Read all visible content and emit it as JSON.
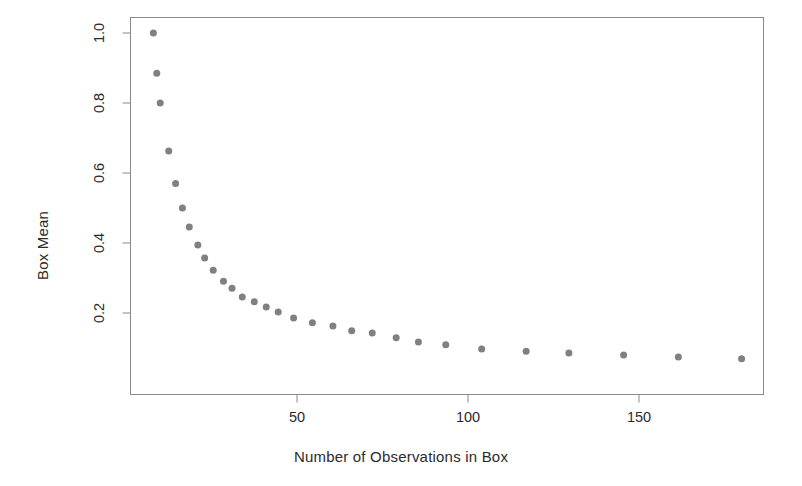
{
  "chart_data": {
    "type": "scatter",
    "title": "",
    "xlabel": "Number of Observations in Box",
    "ylabel": "Box Mean",
    "xlim": [
      4,
      186
    ],
    "ylim": [
      0.03,
      1.04
    ],
    "grid": false,
    "legend": null,
    "point_color": "#808080",
    "point_size": 7,
    "xticks": [
      50,
      100,
      150
    ],
    "xtick_labels": [
      "50",
      "100",
      "150"
    ],
    "yticks": [
      0.2,
      0.4,
      0.6,
      0.8,
      1.0
    ],
    "ytick_labels": [
      "0.2",
      "0.4",
      "0.6",
      "0.8",
      "1.0"
    ],
    "series": [
      {
        "name": "Box Mean",
        "x": [
          8,
          9,
          10,
          12.5,
          14.5,
          16.5,
          18.5,
          21,
          23,
          25.5,
          28.5,
          31,
          34,
          37.5,
          41,
          44.5,
          49,
          54.5,
          60.5,
          66,
          72,
          79,
          85.5,
          93.5,
          104,
          117,
          129.5,
          145.5,
          161.5,
          180
        ],
        "y": [
          1.0,
          0.885,
          0.8,
          0.663,
          0.57,
          0.5,
          0.446,
          0.394,
          0.357,
          0.322,
          0.291,
          0.271,
          0.246,
          0.232,
          0.217,
          0.203,
          0.186,
          0.172,
          0.163,
          0.149,
          0.143,
          0.129,
          0.117,
          0.109,
          0.097,
          0.091,
          0.086,
          0.08,
          0.074,
          0.069
        ],
        "marker": "circle"
      }
    ]
  },
  "axes": {
    "x_axis_name": "x-axis",
    "y_axis_name": "y-axis"
  }
}
